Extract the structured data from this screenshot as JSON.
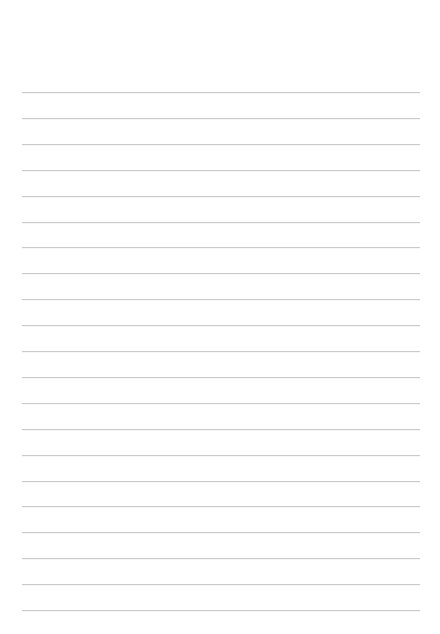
{
  "page": {
    "kind": "lined-paper",
    "width": 440,
    "height": 634,
    "background_color": "#ffffff",
    "title_text": "",
    "header_text": "",
    "footer_text": ""
  },
  "ruling": {
    "line_color": "#c9cacb",
    "line_thickness_px": 1,
    "line_count": 21,
    "line_left_x": 22,
    "line_right_x": 420,
    "line_width_px": 398,
    "first_line_y": 92,
    "last_line_y": 610,
    "line_spacing_px": 25.9,
    "top_margin_px": 92,
    "bottom_margin_px": 23,
    "left_margin_px": 22,
    "right_margin_px": 20,
    "has_vertical_margin_rule": false,
    "has_punch_holes": false
  },
  "lines": [
    {
      "index": 1,
      "y": 92,
      "text": ""
    },
    {
      "index": 2,
      "y": 117.9,
      "text": ""
    },
    {
      "index": 3,
      "y": 143.8,
      "text": ""
    },
    {
      "index": 4,
      "y": 169.7,
      "text": ""
    },
    {
      "index": 5,
      "y": 195.6,
      "text": ""
    },
    {
      "index": 6,
      "y": 221.5,
      "text": ""
    },
    {
      "index": 7,
      "y": 247.4,
      "text": ""
    },
    {
      "index": 8,
      "y": 273.3,
      "text": ""
    },
    {
      "index": 9,
      "y": 299.2,
      "text": ""
    },
    {
      "index": 10,
      "y": 325.1,
      "text": ""
    },
    {
      "index": 11,
      "y": 351.0,
      "text": ""
    },
    {
      "index": 12,
      "y": 376.9,
      "text": ""
    },
    {
      "index": 13,
      "y": 402.8,
      "text": ""
    },
    {
      "index": 14,
      "y": 428.7,
      "text": ""
    },
    {
      "index": 15,
      "y": 454.6,
      "text": ""
    },
    {
      "index": 16,
      "y": 480.5,
      "text": ""
    },
    {
      "index": 17,
      "y": 506.4,
      "text": ""
    },
    {
      "index": 18,
      "y": 532.3,
      "text": ""
    },
    {
      "index": 19,
      "y": 558.2,
      "text": ""
    },
    {
      "index": 20,
      "y": 584.1,
      "text": ""
    },
    {
      "index": 21,
      "y": 610.0,
      "text": ""
    }
  ]
}
